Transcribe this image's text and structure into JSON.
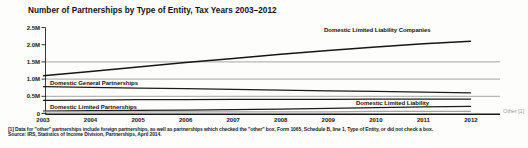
{
  "title": "Number of Partnerships by Type of Entity, Tax Years 2003–2012",
  "footnote": {
    "line1": "[1] Data for \"other\" partnerships include foreign partnerships, as well as partnerships which checked the \"other\" box, Form 1065, Schedule B, line 1, Type of Entity, or did not check a box.",
    "line2": "Source: IRS, Statistics of Income Division, Partnerships, April 2014."
  },
  "colors": {
    "line": "#161616",
    "grid": "#9a9a9a",
    "other_series": "#a3a3a3",
    "other_label": "#9b9b9b",
    "text": "#161616"
  },
  "chart_data": {
    "type": "line",
    "title": "Number of Partnerships by Type of Entity, Tax Years 2003–2012",
    "units": "millions of partnerships",
    "x": [
      2003,
      2004,
      2005,
      2006,
      2007,
      2008,
      2009,
      2010,
      2011,
      2012
    ],
    "series": [
      {
        "name": "Domestic Limited Liability Companies",
        "color": "#161616",
        "values": [
          1.1,
          1.22,
          1.35,
          1.48,
          1.6,
          1.72,
          1.83,
          1.93,
          2.03,
          2.1
        ]
      },
      {
        "name": "Domestic General Partnerships",
        "color": "#1c1c1c",
        "values": [
          0.78,
          0.76,
          0.74,
          0.72,
          0.7,
          0.68,
          0.66,
          0.64,
          0.62,
          0.6
        ]
      },
      {
        "name": "Domestic Limited Partnerships",
        "color": "#1c1c1c",
        "values": [
          0.38,
          0.39,
          0.4,
          0.4,
          0.41,
          0.41,
          0.41,
          0.42,
          0.42,
          0.42
        ]
      },
      {
        "name": "Domestic Limited Liability",
        "color": "#1c1c1c",
        "values": [
          0.07,
          0.08,
          0.09,
          0.1,
          0.11,
          0.13,
          0.15,
          0.17,
          0.19,
          0.21
        ]
      },
      {
        "name": "Other [1]",
        "color": "#a3a3a3",
        "values": [
          0.05,
          0.05,
          0.05,
          0.05,
          0.05,
          0.05,
          0.05,
          0.06,
          0.06,
          0.06
        ]
      }
    ],
    "y_ticks": [
      {
        "label": "2.5M",
        "value": 2.5,
        "grid": false
      },
      {
        "label": "2.0M",
        "value": 2.0,
        "grid": false
      },
      {
        "label": "1.5M",
        "value": 1.5,
        "grid": true
      },
      {
        "label": "1.0M",
        "value": 1.0,
        "grid": true
      },
      {
        "label": "0.5M",
        "value": 0.5,
        "grid": true
      },
      {
        "label": "0",
        "value": 0.0,
        "grid": false
      }
    ],
    "ylim": [
      0,
      2.5
    ],
    "legend": "inline-labels",
    "grid": "horizontal-only"
  }
}
